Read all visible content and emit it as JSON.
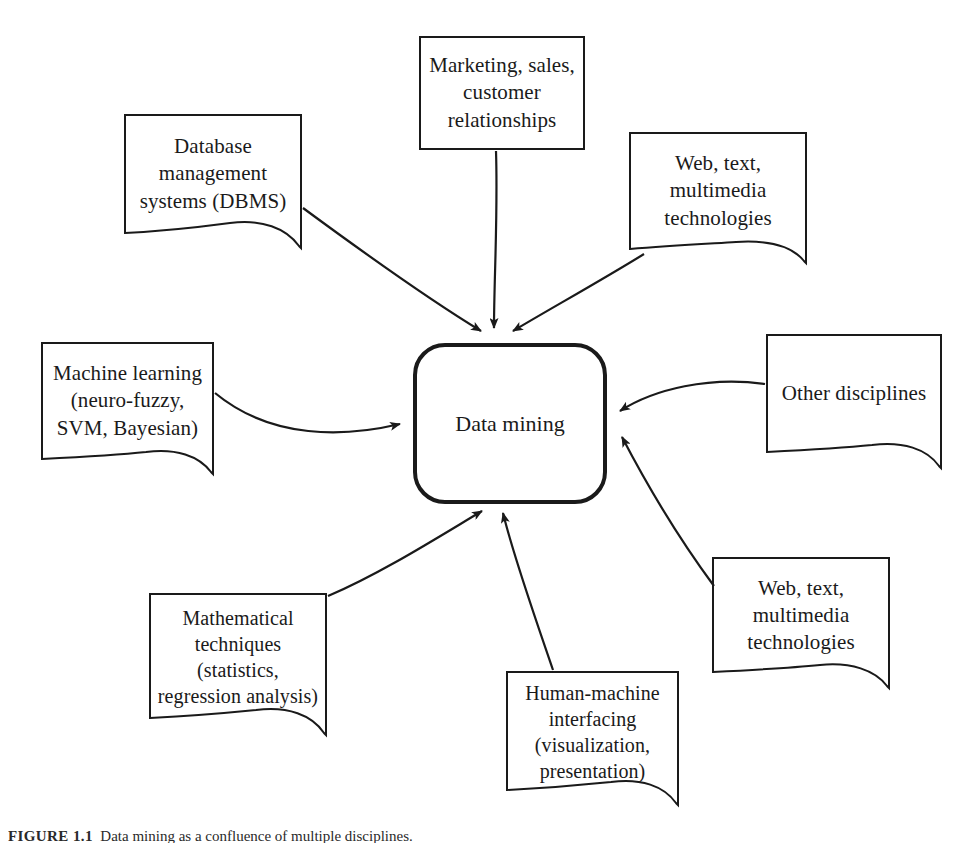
{
  "figure": {
    "center": {
      "label": "Data mining"
    },
    "caption": {
      "id": "FIGURE 1.1",
      "text": "Data mining as a confluence of multiple disciplines."
    },
    "style": {
      "stroke": "#1a1a1a",
      "background": "#ffffff",
      "center_stroke_width": 4,
      "node_stroke_width": 2,
      "arrow_stroke_width": 2.2
    },
    "nodes": [
      {
        "id": "database-management-systems",
        "label": "Database\nmanagement\nsystems (DBMS)",
        "position": "top-left",
        "x": 125,
        "y": 115,
        "width": 176,
        "height": 118
      },
      {
        "id": "marketing-sales-customer-relationships",
        "label": "Marketing, sales,\ncustomer\nrelationships",
        "position": "top-center",
        "x": 420,
        "y": 37,
        "width": 164,
        "height": 112
      },
      {
        "id": "web-text-multimedia-technologies-top",
        "label": "Web, text,\nmultimedia\ntechnologies",
        "position": "top-right",
        "x": 630,
        "y": 133,
        "width": 176,
        "height": 116
      },
      {
        "id": "machine-learning",
        "label": "Machine learning\n(neuro-fuzzy,\nSVM, Bayesian)",
        "position": "left",
        "x": 42,
        "y": 343,
        "width": 171,
        "height": 116
      },
      {
        "id": "other-disciplines",
        "label": "Other disciplines",
        "position": "right",
        "x": 767,
        "y": 335,
        "width": 174,
        "height": 118
      },
      {
        "id": "mathematical-techniques",
        "label": "Mathematical\ntechniques\n(statistics,\nregression analysis)",
        "position": "bottom-left",
        "x": 150,
        "y": 594,
        "width": 176,
        "height": 125
      },
      {
        "id": "human-machine-interfacing",
        "label": "Human-machine\ninterfacing\n(visualization,\npresentation)",
        "position": "bottom-center",
        "x": 507,
        "y": 672,
        "width": 171,
        "height": 119
      },
      {
        "id": "web-text-multimedia-technologies-bottom",
        "label": "Web, text,\nmultimedia\ntechnologies",
        "position": "bottom-right",
        "x": 713,
        "y": 558,
        "width": 176,
        "height": 115
      }
    ],
    "connections": [
      {
        "id": "arrow-dbms-to-center",
        "from": "database-management-systems",
        "to": "center"
      },
      {
        "id": "arrow-marketing-to-center",
        "from": "marketing-sales-customer-relationships",
        "to": "center"
      },
      {
        "id": "arrow-web-top-to-center",
        "from": "web-text-multimedia-technologies-top",
        "to": "center"
      },
      {
        "id": "arrow-machine-learning-to-center",
        "from": "machine-learning",
        "to": "center"
      },
      {
        "id": "arrow-other-disciplines-to-center",
        "from": "other-disciplines",
        "to": "center"
      },
      {
        "id": "arrow-mathematical-to-center",
        "from": "mathematical-techniques",
        "to": "center"
      },
      {
        "id": "arrow-human-machine-to-center",
        "from": "human-machine-interfacing",
        "to": "center"
      },
      {
        "id": "arrow-web-bottom-to-center",
        "from": "web-text-multimedia-technologies-bottom",
        "to": "center"
      }
    ]
  }
}
